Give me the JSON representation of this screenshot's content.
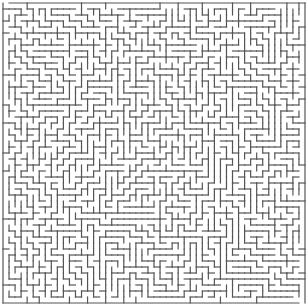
{
  "maze": {
    "title": "Maze",
    "rows": 50,
    "cols": 50,
    "seed": 20240607,
    "wall_color": "#555555",
    "background_color": "#ffffff",
    "entrance": "top-left",
    "exit": "bottom-right"
  }
}
